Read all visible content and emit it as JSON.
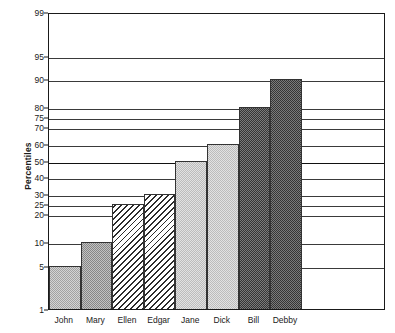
{
  "chart_data": {
    "type": "bar",
    "title": "",
    "xlabel": "",
    "ylabel": "Percentiles",
    "categories": [
      "John",
      "Mary",
      "Ellen",
      "Edgar",
      "Jane",
      "Dick",
      "Bill",
      "Debby"
    ],
    "values": [
      5,
      10,
      25,
      30,
      50,
      60,
      80,
      90
    ],
    "ylim": [
      1,
      99
    ],
    "yscale": "probability",
    "ytick_labels": [
      "99",
      "95",
      "90",
      "80",
      "75",
      "70",
      "60",
      "50",
      "40",
      "30",
      "25",
      "20",
      "10",
      "5",
      "1"
    ],
    "ytick_values": [
      99,
      95,
      90,
      80,
      75,
      70,
      60,
      50,
      40,
      30,
      25,
      20,
      10,
      5,
      1
    ],
    "grid": true,
    "legend": "none",
    "bars": [
      {
        "label": "John",
        "value": 5,
        "fill": "light-gray-dither",
        "fill_color": "#d4d4d4"
      },
      {
        "label": "Mary",
        "value": 10,
        "fill": "medium-gray-dither",
        "fill_color": "#c2c2c2"
      },
      {
        "label": "Ellen",
        "value": 25,
        "fill": "diagonal-hatch",
        "fill_color": "#ffffff"
      },
      {
        "label": "Edgar",
        "value": 30,
        "fill": "diagonal-hatch",
        "fill_color": "#ffffff"
      },
      {
        "label": "Jane",
        "value": 50,
        "fill": "pale-gray-dither",
        "fill_color": "#e2e2e2"
      },
      {
        "label": "Dick",
        "value": 60,
        "fill": "pale-gray-dither",
        "fill_color": "#e2e2e2"
      },
      {
        "label": "Bill",
        "value": 80,
        "fill": "dark-gray-dither",
        "fill_color": "#7a7a7a"
      },
      {
        "label": "Debby",
        "value": 90,
        "fill": "dark-gray-dither",
        "fill_color": "#7a7a7a"
      }
    ],
    "axis_color": "#1a1a1a",
    "grid_color": "#3a3a3a",
    "major_grid_values": [
      50
    ],
    "background": "#ffffff"
  }
}
